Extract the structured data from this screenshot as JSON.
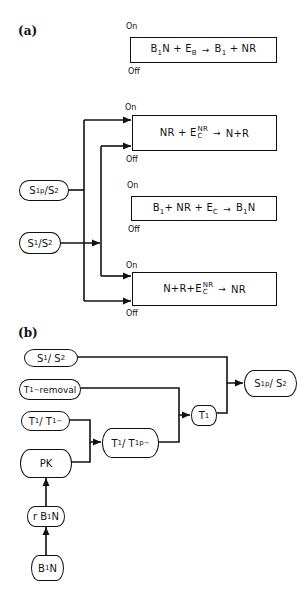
{
  "panels": {
    "a": {
      "label": "(a)",
      "reactions": [
        {
          "on": "On",
          "off": "Off",
          "lhs_a": "B",
          "lhs_a_sub": "1",
          "lhs_b": "N + E",
          "lhs_b_sub": "B",
          "arrow": "→",
          "rhs_a": "B",
          "rhs_a_sub": "1",
          "rhs_b": " + NR"
        },
        {
          "on": "On",
          "off": "Off",
          "lhs": "NR + E",
          "sup": "NR",
          "sub": "C",
          "arrow": "→",
          "rhs": "N+R"
        },
        {
          "on": "On",
          "off": "Off",
          "lhs_a": "B",
          "lhs_a_sub": "1",
          "lhs_b": "+ NR + E",
          "lhs_b_sub": "C",
          "arrow": "→",
          "rhs_a": "B",
          "rhs_a_sub": "1",
          "rhs_b": "N"
        },
        {
          "on": "On",
          "off": "Off",
          "lhs": "N+R+E",
          "sup": "NR",
          "sub": "C",
          "arrow": "→",
          "rhs": "NR"
        }
      ],
      "inputs": [
        {
          "main": "S",
          "sub": "1p",
          "slash": "/S",
          "sub2": "2"
        },
        {
          "main": "S",
          "sub": "1",
          "slash": "/S",
          "sub2": "2"
        }
      ]
    },
    "b": {
      "label": "(b)",
      "nodes": {
        "s1s2": {
          "main": "S",
          "sub": "1",
          "slash": "/ S",
          "sub2": "2"
        },
        "t1removal": {
          "main": "T",
          "sub": "1",
          "tilde": "~",
          "rest": "removal"
        },
        "t1t1": {
          "main": "T",
          "sub": "1",
          "slash": " / T",
          "sub2": "1",
          "tilde": "~"
        },
        "pk": {
          "text": "PK"
        },
        "rb1n": {
          "pre": "r B",
          "sub": "1",
          "post": "N"
        },
        "b1n": {
          "pre": "B",
          "sub": "1",
          "post": "N"
        },
        "t1t1p": {
          "main": "T",
          "sub": "1",
          "slash": "/ T",
          "sub2": "1p",
          "tilde": "~"
        },
        "t1": {
          "main": "T",
          "sub": "1"
        },
        "s1ps2": {
          "main": "S",
          "sub": "1p",
          "slash": " / S",
          "sub2": "2"
        }
      }
    }
  }
}
